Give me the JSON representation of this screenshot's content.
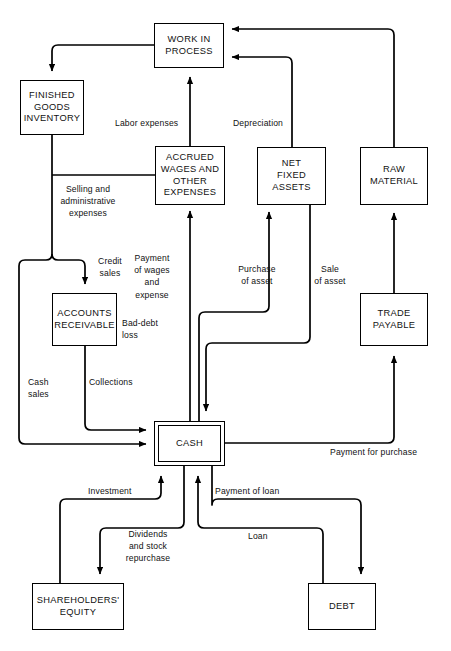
{
  "diagram": {
    "type": "flowchart",
    "background_color": "#ffffff",
    "line_color": "#000000",
    "text_color": "#111111",
    "nodes": [
      {
        "id": "work_in_process",
        "label": "WORK IN\nPROCESS",
        "x": 154,
        "y": 23,
        "w": 70,
        "h": 45,
        "style": "single"
      },
      {
        "id": "finished_goods",
        "label": "FINISHED\nGOODS\nINVENTORY",
        "x": 20,
        "y": 80,
        "w": 64,
        "h": 55,
        "style": "single"
      },
      {
        "id": "accrued_wages",
        "label": "ACCRUED\nWAGES AND\nOTHER\nEXPENSES",
        "x": 155,
        "y": 146,
        "w": 70,
        "h": 59,
        "style": "single"
      },
      {
        "id": "net_fixed_assets",
        "label": "NET\nFIXED\nASSETS",
        "x": 257,
        "y": 147,
        "w": 69,
        "h": 58,
        "style": "single"
      },
      {
        "id": "raw_material",
        "label": "RAW\nMATERIAL",
        "x": 360,
        "y": 147,
        "w": 68,
        "h": 58,
        "style": "single"
      },
      {
        "id": "accounts_receivable",
        "label": "ACCOUNTS\nRECEIVABLE",
        "x": 52,
        "y": 293,
        "w": 65,
        "h": 53,
        "style": "single"
      },
      {
        "id": "trade_payable",
        "label": "TRADE\nPAYABLE",
        "x": 360,
        "y": 293,
        "w": 68,
        "h": 53,
        "style": "single"
      },
      {
        "id": "cash",
        "label": "CASH",
        "x": 154,
        "y": 421,
        "w": 71,
        "h": 45,
        "style": "double"
      },
      {
        "id": "shareholders_equity",
        "label": "SHAREHOLDERS'\nEQUITY",
        "x": 32,
        "y": 583,
        "w": 92,
        "h": 47,
        "style": "single"
      },
      {
        "id": "debt",
        "label": "DEBT",
        "x": 308,
        "y": 583,
        "w": 68,
        "h": 47,
        "style": "single"
      }
    ],
    "edge_labels": [
      {
        "id": "labor_expenses",
        "text": "Labor expenses",
        "x": 115,
        "y": 117,
        "align": "left"
      },
      {
        "id": "depreciation",
        "text": "Depreciation",
        "x": 233,
        "y": 117,
        "align": "left"
      },
      {
        "id": "selling_admin",
        "text": "Selling and\nadministrative\nexpenses",
        "x": 88,
        "y": 183,
        "align": "center"
      },
      {
        "id": "credit_sales",
        "text": "Credit\nsales",
        "x": 110,
        "y": 255,
        "align": "center"
      },
      {
        "id": "payment_wages",
        "text": "Payment\nof wages\nand\nexpense",
        "x": 152,
        "y": 252,
        "align": "center"
      },
      {
        "id": "purchase_of_asset",
        "text": "Purchase\nof asset",
        "x": 257,
        "y": 263,
        "align": "center"
      },
      {
        "id": "sale_of_asset",
        "text": "Sale\nof asset",
        "x": 330,
        "y": 263,
        "align": "center"
      },
      {
        "id": "bad_debt_loss",
        "text": "Bad-debt\nloss",
        "x": 122,
        "y": 317,
        "align": "left"
      },
      {
        "id": "cash_sales",
        "text": "Cash\nsales",
        "x": 28,
        "y": 376,
        "align": "left"
      },
      {
        "id": "collections",
        "text": "Collections",
        "x": 89,
        "y": 376,
        "align": "left"
      },
      {
        "id": "payment_for_purchase",
        "text": "Payment for purchase",
        "x": 330,
        "y": 446,
        "align": "left"
      },
      {
        "id": "investment",
        "text": "Investment",
        "x": 88,
        "y": 485,
        "align": "left"
      },
      {
        "id": "payment_of_loan",
        "text": "Payment of loan",
        "x": 215,
        "y": 485,
        "align": "left"
      },
      {
        "id": "dividends_repurchase",
        "text": "Dividends\nand stock\nrepurchase",
        "x": 148,
        "y": 528,
        "align": "center"
      },
      {
        "id": "loan",
        "text": "Loan",
        "x": 248,
        "y": 530,
        "align": "left"
      }
    ],
    "edges": [
      {
        "id": "wip-to-finished-goods",
        "from": "work_in_process",
        "to": "finished_goods",
        "label": ""
      },
      {
        "id": "fg-to-accounts-recv",
        "from": "finished_goods",
        "to": "accounts_receivable",
        "label": "Credit sales"
      },
      {
        "id": "fg-to-cash",
        "from": "finished_goods",
        "to": "cash",
        "label": "Cash sales"
      },
      {
        "id": "accounts-recv-to-cash",
        "from": "accounts_receivable",
        "to": "cash",
        "label": "Collections"
      },
      {
        "id": "accrued-to-wip",
        "from": "accrued_wages",
        "to": "work_in_process",
        "label": "Labor expenses"
      },
      {
        "id": "nfa-to-wip",
        "from": "net_fixed_assets",
        "to": "work_in_process",
        "label": "Depreciation"
      },
      {
        "id": "raw-to-wip",
        "from": "raw_material",
        "to": "work_in_process",
        "label": ""
      },
      {
        "id": "cash-to-accrued",
        "from": "cash",
        "to": "accrued_wages",
        "label": "Payment of wages and expense"
      },
      {
        "id": "cash-to-nfa",
        "from": "cash",
        "to": "net_fixed_assets",
        "label": "Purchase of asset"
      },
      {
        "id": "nfa-to-cash",
        "from": "net_fixed_assets",
        "to": "cash",
        "label": "Sale of asset"
      },
      {
        "id": "trade-to-raw",
        "from": "trade_payable",
        "to": "raw_material",
        "label": ""
      },
      {
        "id": "cash-to-trade",
        "from": "cash",
        "to": "trade_payable",
        "label": "Payment for purchase"
      },
      {
        "id": "equity-to-cash",
        "from": "shareholders_equity",
        "to": "cash",
        "label": "Investment"
      },
      {
        "id": "cash-to-equity",
        "from": "cash",
        "to": "shareholders_equity",
        "label": "Dividends and stock repurchase"
      },
      {
        "id": "debt-to-cash",
        "from": "debt",
        "to": "cash",
        "label": "Loan"
      },
      {
        "id": "cash-to-debt",
        "from": "cash",
        "to": "debt",
        "label": "Payment of loan"
      }
    ]
  }
}
